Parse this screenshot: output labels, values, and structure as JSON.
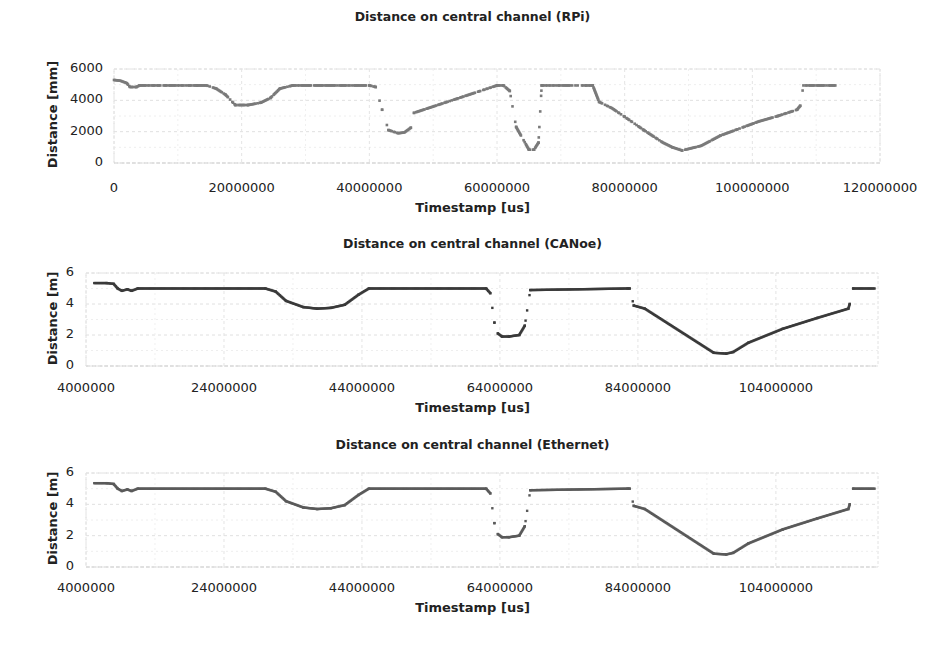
{
  "chart_data": [
    {
      "type": "line",
      "title": "Distance on central channel (RPi)",
      "xlabel": "Timestamp [us]",
      "ylabel": "Distance [mm]",
      "xlim": [
        0,
        120000000
      ],
      "ylim": [
        0,
        6000
      ],
      "xticks": [
        0,
        20000000,
        40000000,
        60000000,
        80000000,
        100000000,
        120000000
      ],
      "xtick_labels": [
        "0",
        "20000000",
        "40000000",
        "60000000",
        "80000000",
        "100000000",
        "120000000"
      ],
      "yticks": [
        0,
        2000,
        4000,
        6000
      ],
      "ytick_labels": [
        "0",
        "2000",
        "4000",
        "6000"
      ],
      "grid": true,
      "legend": null,
      "series": [
        {
          "name": "RPi distance",
          "color": "#7a7a7a",
          "style": "dotted-markers",
          "x": [
            0,
            1000000,
            2000000,
            2500000,
            3500000,
            4000000,
            10000000,
            13000000,
            14500000,
            16000000,
            17500000,
            19000000,
            21000000,
            23000000,
            24500000,
            26000000,
            28000000,
            30000000,
            40000000,
            41000000,
            42000000,
            43000000,
            44500000,
            45500000,
            46500000,
            47000000,
            60000000,
            61000000,
            62000000,
            63000000,
            65000000,
            65800000,
            66500000,
            67000000,
            74000000,
            75000000,
            76000000,
            78000000,
            80000000,
            83000000,
            86000000,
            87500000,
            89000000,
            92000000,
            95000000,
            98000000,
            101000000,
            104000000,
            107000000,
            107500000,
            108000000,
            113000000
          ],
          "y": [
            5300,
            5250,
            5100,
            4850,
            4850,
            4950,
            4950,
            4950,
            4950,
            4750,
            4350,
            3700,
            3700,
            3850,
            4150,
            4750,
            4950,
            4950,
            4950,
            4850,
            3400,
            2100,
            1900,
            1950,
            2250,
            3200,
            4950,
            4950,
            4600,
            2300,
            850,
            850,
            1300,
            4950,
            4950,
            4950,
            3900,
            3500,
            2950,
            2100,
            1300,
            1000,
            800,
            1100,
            1750,
            2200,
            2650,
            3000,
            3400,
            3650,
            4950,
            4950
          ]
        }
      ]
    },
    {
      "type": "line",
      "title": "Distance on central channel (CANoe)",
      "xlabel": "Timestamp [us]",
      "ylabel": "Distance [m]",
      "xlim": [
        4000000,
        118800000
      ],
      "ylim": [
        0,
        6
      ],
      "xticks": [
        4000000,
        24000000,
        44000000,
        64000000,
        84000000,
        104000000
      ],
      "xtick_labels": [
        "4000000",
        "24000000",
        "44000000",
        "64000000",
        "84000000",
        "104000000"
      ],
      "yticks": [
        0,
        2,
        4,
        6
      ],
      "ytick_labels": [
        "0",
        "2",
        "4",
        "6"
      ],
      "grid": true,
      "legend": null,
      "series": [
        {
          "name": "CANoe distance",
          "color": "#3a3a3a",
          "style": "dense-markers",
          "x": [
            5200000,
            7000000,
            8000000,
            8600000,
            9200000,
            10000000,
            10600000,
            11500000,
            30000000,
            31500000,
            33000000,
            35500000,
            37500000,
            39500000,
            41500000,
            43500000,
            45000000,
            62000000,
            62600000,
            63200000,
            63700000,
            64300000,
            65300000,
            66800000,
            67600000,
            68400000,
            82500000,
            82800000,
            83400000,
            85000000,
            95000000,
            96800000,
            97800000,
            100000000,
            105000000,
            110000000,
            114500000,
            114700000,
            115200000,
            118300000
          ],
          "y": [
            5.35,
            5.35,
            5.3,
            5.0,
            4.85,
            4.95,
            4.85,
            5.0,
            5.0,
            4.8,
            4.2,
            3.8,
            3.7,
            3.75,
            3.95,
            4.6,
            5.0,
            5.0,
            4.7,
            2.8,
            2.1,
            1.9,
            1.9,
            2.0,
            2.6,
            4.9,
            5.0,
            5.0,
            3.9,
            3.7,
            0.85,
            0.8,
            0.9,
            1.5,
            2.4,
            3.1,
            3.7,
            4.0,
            5.0,
            5.0
          ]
        }
      ]
    },
    {
      "type": "line",
      "title": "Distance on central channel (Ethernet)",
      "xlabel": "Timestamp [us]",
      "ylabel": "Distance [m]",
      "xlim": [
        4000000,
        118800000
      ],
      "ylim": [
        0,
        6
      ],
      "xticks": [
        4000000,
        24000000,
        44000000,
        64000000,
        84000000,
        104000000
      ],
      "xtick_labels": [
        "4000000",
        "24000000",
        "44000000",
        "64000000",
        "84000000",
        "104000000"
      ],
      "yticks": [
        0,
        2,
        4,
        6
      ],
      "ytick_labels": [
        "0",
        "2",
        "4",
        "6"
      ],
      "grid": true,
      "legend": null,
      "series": [
        {
          "name": "Ethernet distance",
          "color": "#5a5a5a",
          "style": "dense-markers",
          "x": [
            5200000,
            7000000,
            8000000,
            8600000,
            9200000,
            10000000,
            10600000,
            11500000,
            30000000,
            31500000,
            33000000,
            35500000,
            37500000,
            39500000,
            41500000,
            43500000,
            45000000,
            62000000,
            62600000,
            63200000,
            63700000,
            64300000,
            65300000,
            66800000,
            67600000,
            68400000,
            82500000,
            82800000,
            83400000,
            85000000,
            95000000,
            96800000,
            97800000,
            100000000,
            105000000,
            110000000,
            114500000,
            114700000,
            115200000,
            118300000
          ],
          "y": [
            5.35,
            5.35,
            5.3,
            5.0,
            4.85,
            4.95,
            4.85,
            5.0,
            5.0,
            4.8,
            4.2,
            3.8,
            3.7,
            3.75,
            3.95,
            4.6,
            5.0,
            5.0,
            4.7,
            2.8,
            2.1,
            1.9,
            1.9,
            2.0,
            2.6,
            4.9,
            5.0,
            5.0,
            3.9,
            3.7,
            0.85,
            0.8,
            0.9,
            1.5,
            2.4,
            3.1,
            3.7,
            4.0,
            5.0,
            5.0
          ]
        }
      ]
    }
  ],
  "layout": [
    {
      "top": 0,
      "title_y": 9,
      "plot": {
        "left": 114,
        "right": 880,
        "top": 69,
        "bottom": 163
      },
      "xtick_y": 180,
      "xlabel_y": 200,
      "ylabel_cx": 52,
      "ytick_right": 103
    },
    {
      "top": 0,
      "title_y": 236,
      "plot": {
        "left": 86,
        "right": 878,
        "top": 273,
        "bottom": 366
      },
      "xtick_y": 380,
      "xlabel_y": 400,
      "ylabel_cx": 52,
      "ytick_right": 74
    },
    {
      "top": 0,
      "title_y": 437,
      "plot": {
        "left": 86,
        "right": 878,
        "top": 473,
        "bottom": 567
      },
      "xtick_y": 580,
      "xlabel_y": 600,
      "ylabel_cx": 52,
      "ytick_right": 74
    }
  ]
}
